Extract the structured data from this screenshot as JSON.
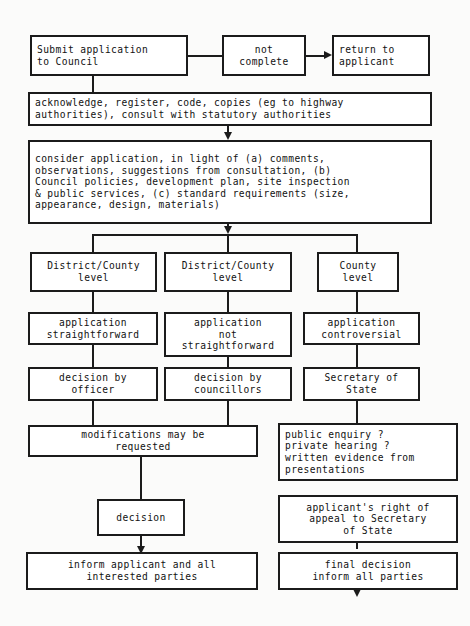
{
  "diagram": {
    "colors": {
      "stroke": "#1b1b1b",
      "fill": "#ffffff",
      "background": "#fbfbfa",
      "text": "#111111"
    },
    "nodes": {
      "submit": "Submit application\nto Council",
      "not_complete": "not\ncomplete",
      "return_applicant": "return to\napplicant",
      "acknowledge": "acknowledge, register, code, copies (eg to highway\nauthorities), consult with statutory authorities",
      "consider": "consider application, in light of (a) comments,\nobservations, suggestions from consultation, (b)\nCouncil policies, development plan, site inspection\n& public services, (c) standard requirements (size,\nappearance, design, materials)",
      "level_1": "District/County\nlevel",
      "level_2": "District/County\nlevel",
      "level_3": "County\nlevel",
      "app_straightforward": "application\nstraightforward",
      "app_not_straightforward": "application\nnot\nstraightforward",
      "app_controversial": "application\ncontroversial",
      "decision_officer": "decision by\nofficer",
      "decision_councillors": "decision by\ncouncillors",
      "secretary_of_state": "Secretary of\nState",
      "modifications": "modifications may be\nrequested",
      "enquiry": "public enquiry ?\nprivate hearing ?\nwritten evidence from\npresentations",
      "decision": "decision",
      "right_of_appeal": "applicant's right of\nappeal to Secretary\nof State",
      "inform_applicant": "inform applicant and all\ninterested parties",
      "final_decision": "final decision\ninform all parties"
    }
  }
}
